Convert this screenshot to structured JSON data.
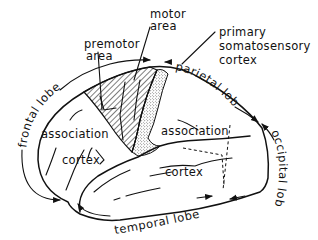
{
  "diagram": {
    "type": "anatomical-brain-lateral-view",
    "labels": {
      "premotor_line1": "premotor",
      "premotor_line2": "area",
      "motor_line1": "motor",
      "motor_line2": "area",
      "somato_line1": "primary",
      "somato_line2": "somatosensory",
      "somato_line3": "cortex",
      "frontal_assoc_line1": "association",
      "frontal_assoc_line2": "cortex",
      "posterior_assoc_line1": "association",
      "posterior_assoc_line2": "cortex"
    },
    "lobes": {
      "frontal": "frontal lobe",
      "parietal": "parietal lobe",
      "occipital": "occipital lobe",
      "temporal": "temporal lobe"
    },
    "colors": {
      "ink": "#111111",
      "background": "#ffffff"
    }
  }
}
